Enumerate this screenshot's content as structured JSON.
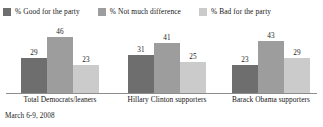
{
  "legend": {
    "entries": [
      {
        "label": "% Good for the party",
        "color": "#6e6e6e",
        "swatch_name": "legend-swatch-good"
      },
      {
        "label": "% Not much difference",
        "color": "#9d9d9d",
        "swatch_name": "legend-swatch-not-much-difference"
      },
      {
        "label": "% Bad for the party",
        "color": "#cbcbcb",
        "swatch_name": "legend-swatch-bad"
      }
    ]
  },
  "footnote": "March 6-9, 2008",
  "chart_data": {
    "type": "bar",
    "title": "",
    "subtitle": "",
    "xlabel": "",
    "ylabel": "",
    "ylim": [
      0,
      50
    ],
    "grid": false,
    "legend_position": "top-left",
    "categories": [
      "Total Democrats/leaners",
      "Hillary Clinton supporters",
      "Barack Obama supporters"
    ],
    "series": [
      {
        "name": "% Good for the party",
        "color": "#6e6e6e",
        "values": [
          29,
          31,
          23
        ]
      },
      {
        "name": "% Not much difference",
        "color": "#9d9d9d",
        "values": [
          46,
          41,
          43
        ]
      },
      {
        "name": "% Bad for the party",
        "color": "#cbcbcb",
        "values": [
          23,
          25,
          29
        ]
      }
    ]
  }
}
